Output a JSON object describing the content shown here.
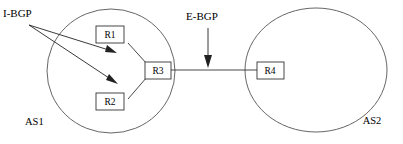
{
  "diagram": {
    "labels": {
      "ibgp": "I-BGP",
      "ebgp": "E-BGP",
      "as1": "AS1",
      "as2": "AS2"
    },
    "routers": [
      {
        "id": "r1",
        "label": "R1",
        "as": "AS1",
        "x": 110,
        "y": 35
      },
      {
        "id": "r2",
        "label": "R2",
        "as": "AS1",
        "x": 110,
        "y": 102
      },
      {
        "id": "r3",
        "label": "R3",
        "as": "AS1",
        "x": 158,
        "y": 70
      },
      {
        "id": "r4",
        "label": "R4",
        "as": "AS2",
        "x": 270,
        "y": 70
      }
    ],
    "autonomous_systems": [
      {
        "id": "as1",
        "label": "AS1",
        "cx": 111,
        "cy": 71,
        "rx": 64,
        "ry": 62
      },
      {
        "id": "as2",
        "label": "AS2",
        "cx": 316,
        "cy": 70,
        "rx": 71,
        "ry": 62
      }
    ],
    "links": [
      {
        "from": "R1",
        "to": "R3",
        "kind": "internal"
      },
      {
        "from": "R2",
        "to": "R3",
        "kind": "internal"
      },
      {
        "from": "R3",
        "to": "R4",
        "kind": "external"
      }
    ],
    "annotations": [
      {
        "label": "I-BGP",
        "points_to": [
          "R1-R3 link",
          "R2-R3 link"
        ],
        "arrows": 2
      },
      {
        "label": "E-BGP",
        "points_to": [
          "R3-R4 link"
        ],
        "arrows": 1
      }
    ],
    "colors": {
      "stroke": "#333333",
      "circle_stroke": "#555555",
      "text": "#000000",
      "background": "#ffffff"
    }
  }
}
